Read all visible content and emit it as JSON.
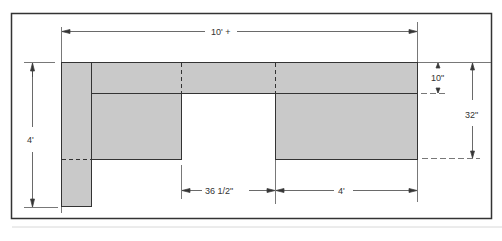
{
  "diagram": {
    "type": "floor-plan-dimension-drawing",
    "colors": {
      "fill": "#c9c9c9",
      "line": "#333333",
      "background": "#ffffff"
    },
    "dimensions": {
      "overall_width": "10' +",
      "left_height": "4'",
      "top_strip_depth": "10\"",
      "right_depth": "32\"",
      "gap_width": "36 1/2\"",
      "right_block_width": "4'"
    }
  }
}
